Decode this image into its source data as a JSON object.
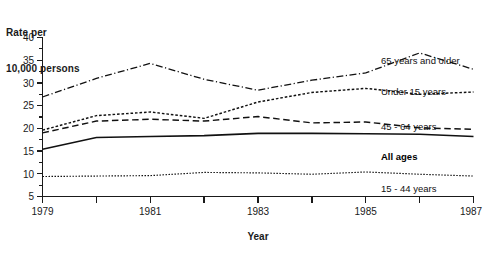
{
  "chart_data": {
    "type": "line",
    "title": "",
    "ylabel": "Rate per\n10,000 persons",
    "ylabel_line1": "Rate per",
    "ylabel_line2": "10,000 persons",
    "xlabel": "Year",
    "grid": false,
    "legend_position": "inline-right-of-series",
    "x": [
      1979,
      1980,
      1981,
      1982,
      1983,
      1984,
      1985,
      1986,
      1987
    ],
    "xtick_labels": [
      "1979",
      "",
      "1981",
      "",
      "1983",
      "",
      "1985",
      "",
      "1987"
    ],
    "xlim": [
      1979,
      1987
    ],
    "ylim": [
      5,
      40
    ],
    "ytick_labels": [
      "5",
      "10",
      "15",
      "20",
      "25",
      "30",
      "35",
      "40"
    ],
    "ytick_values": [
      5,
      10,
      15,
      20,
      25,
      30,
      35,
      40
    ],
    "yminor_step": 2.5,
    "series": [
      {
        "name": "65 years and older",
        "label": "65 years and older",
        "style": "dash-dot",
        "values": [
          26.9,
          31.0,
          34.3,
          30.8,
          28.4,
          30.6,
          32.2,
          36.6,
          33.0
        ]
      },
      {
        "name": "Under 15 years",
        "label": "Under 15 years",
        "style": "dotted-dense",
        "values": [
          19.6,
          22.8,
          23.6,
          22.2,
          25.8,
          27.9,
          28.8,
          27.5,
          28.0
        ]
      },
      {
        "name": "45 - 64 years",
        "label": "45 - 64 years",
        "style": "dashed",
        "values": [
          19.0,
          21.6,
          22.0,
          21.6,
          22.6,
          21.2,
          21.4,
          20.1,
          19.8
        ]
      },
      {
        "name": "All ages",
        "label": "All ages",
        "style": "solid",
        "values": [
          15.4,
          18.0,
          18.2,
          18.4,
          18.9,
          18.9,
          18.8,
          18.7,
          18.2
        ]
      },
      {
        "name": "15 - 44 years",
        "label": "15 - 44 years",
        "style": "dotted-fine",
        "values": [
          9.4,
          9.5,
          9.6,
          10.3,
          10.2,
          9.9,
          10.4,
          9.9,
          9.5
        ]
      }
    ]
  },
  "labels": {
    "s65": "65 years and older",
    "sunder15": "Under 15 years",
    "s4564": "45 - 64 years",
    "sall": "All ages",
    "s1544": "15 - 44 years"
  },
  "colors": {
    "ink": "#111111",
    "background": "#ffffff"
  }
}
